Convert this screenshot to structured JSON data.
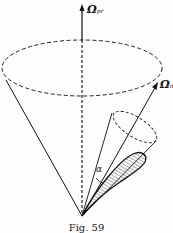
{
  "figure": {
    "caption": "Fig. 59",
    "labels": {
      "axis_vertical": {
        "symbol": "Ω",
        "subscript": "pr"
      },
      "axis_tilted": {
        "symbol": "Ω",
        "subscript": "n"
      },
      "angle": "α"
    }
  }
}
